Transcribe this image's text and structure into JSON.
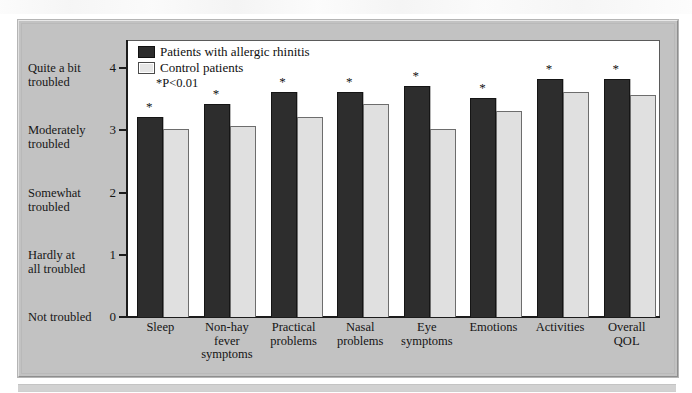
{
  "figure": {
    "legend": {
      "series_dark_label": "Patients with allergic rhinitis",
      "series_light_label": "Control patients",
      "significance_note": "*P<0.01"
    },
    "y_axis": {
      "ticks": [
        {
          "value": "4",
          "label_line1": "Quite a bit",
          "label_line2": "troubled"
        },
        {
          "value": "3",
          "label_line1": "Moderately",
          "label_line2": "troubled"
        },
        {
          "value": "2",
          "label_line1": "Somewhat",
          "label_line2": "troubled"
        },
        {
          "value": "1",
          "label_line1": "Hardly at",
          "label_line2": "all troubled"
        },
        {
          "value": "0",
          "label_line1": "Not troubled",
          "label_line2": ""
        }
      ]
    },
    "x_labels": [
      {
        "line1": "Sleep",
        "line2": "",
        "line3": ""
      },
      {
        "line1": "Non-hay",
        "line2": "fever",
        "line3": "symptoms"
      },
      {
        "line1": "Practical",
        "line2": "problems",
        "line3": ""
      },
      {
        "line1": "Nasal",
        "line2": "problems",
        "line3": ""
      },
      {
        "line1": "Eye",
        "line2": "symptoms",
        "line3": ""
      },
      {
        "line1": "Emotions",
        "line2": "",
        "line3": ""
      },
      {
        "line1": "Activities",
        "line2": "",
        "line3": ""
      },
      {
        "line1": "Overall",
        "line2": "QOL",
        "line3": ""
      }
    ],
    "star_marker": "*",
    "colors": {
      "panel_background": "#c2c2c2",
      "plot_background": "#ffffff",
      "series_dark": "#2d2d2d",
      "series_light": "#e0e0e0",
      "axis": "#1c1c1c"
    }
  },
  "chart_data": {
    "type": "bar",
    "title": "",
    "xlabel": "",
    "ylabel": "",
    "ylim": [
      0,
      4
    ],
    "yticks": [
      0,
      1,
      2,
      3,
      4
    ],
    "ytick_labels": [
      "Not troubled 0",
      "Hardly at all troubled 1",
      "Somewhat troubled 2",
      "Moderately troubled 3",
      "Quite a bit troubled 4"
    ],
    "grid": false,
    "legend_position": "top-left",
    "categories": [
      "Sleep",
      "Non-hay fever symptoms",
      "Practical problems",
      "Nasal problems",
      "Eye symptoms",
      "Emotions",
      "Activities",
      "Overall QOL"
    ],
    "series": [
      {
        "name": "Patients with allergic rhinitis",
        "color": "#2d2d2d",
        "values": [
          3.2,
          3.4,
          3.6,
          3.6,
          3.7,
          3.5,
          3.8,
          3.8
        ]
      },
      {
        "name": "Control patients",
        "color": "#e0e0e0",
        "values": [
          3.0,
          3.05,
          3.2,
          3.4,
          3.0,
          3.3,
          3.6,
          3.55
        ]
      }
    ],
    "annotations": [
      {
        "category": "Sleep",
        "series": "Patients with allergic rhinitis",
        "marker": "*"
      },
      {
        "category": "Non-hay fever symptoms",
        "series": "Patients with allergic rhinitis",
        "marker": "*"
      },
      {
        "category": "Practical problems",
        "series": "Patients with allergic rhinitis",
        "marker": "*"
      },
      {
        "category": "Nasal problems",
        "series": "Patients with allergic rhinitis",
        "marker": "*"
      },
      {
        "category": "Eye symptoms",
        "series": "Patients with allergic rhinitis",
        "marker": "*"
      },
      {
        "category": "Emotions",
        "series": "Patients with allergic rhinitis",
        "marker": "*"
      },
      {
        "category": "Activities",
        "series": "Patients with allergic rhinitis",
        "marker": "*"
      },
      {
        "category": "Overall QOL",
        "series": "Patients with allergic rhinitis",
        "marker": "*"
      }
    ],
    "note": "*P<0.01"
  }
}
